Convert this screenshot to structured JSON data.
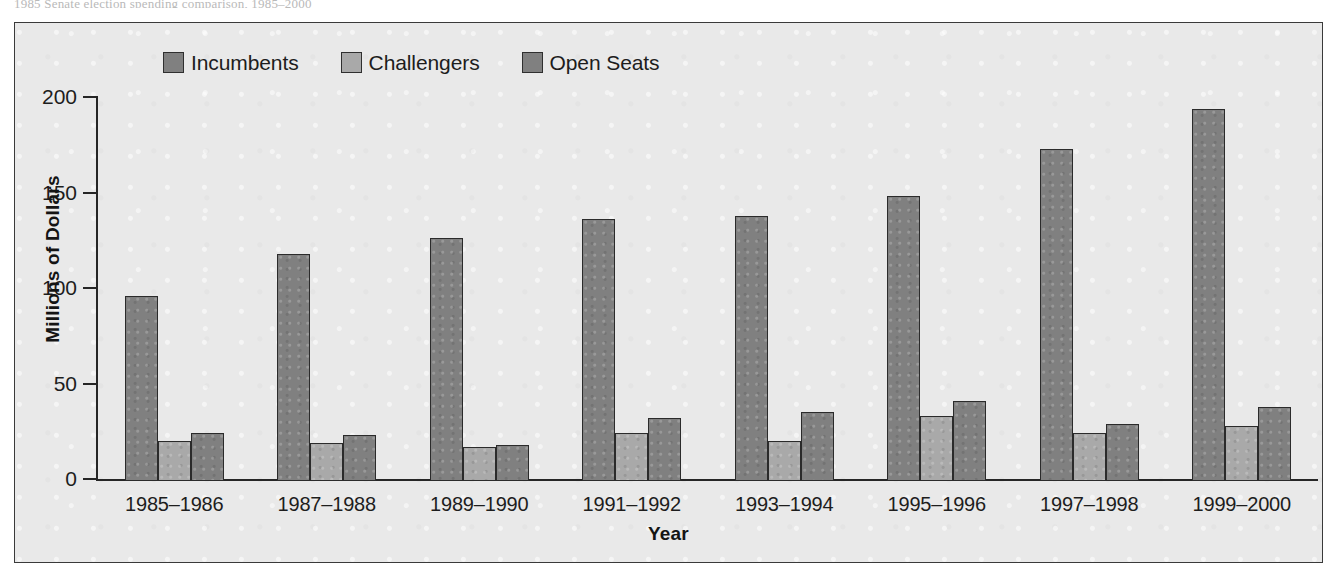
{
  "top_caption": "1985 Senate election spending comparison, 1985–2000",
  "legend": {
    "items": [
      {
        "label": "Incumbents",
        "color": "#808080"
      },
      {
        "label": "Challengers",
        "color": "#a9a9a9"
      },
      {
        "label": "Open Seats",
        "color": "#808080"
      }
    ]
  },
  "axes": {
    "ylabel": "Millions of Dollars",
    "xlabel": "Year",
    "yticks": [
      "200",
      "150",
      "100",
      "50",
      "0"
    ]
  },
  "chart_data": {
    "type": "bar",
    "title": "",
    "xlabel": "Year",
    "ylabel": "Millions of Dollars",
    "ylim": [
      0,
      200
    ],
    "yticks": [
      0,
      50,
      100,
      150,
      200
    ],
    "grid": false,
    "legend_position": "top-left",
    "categories": [
      "1985–1986",
      "1987–1988",
      "1989–1990",
      "1991–1992",
      "1993–1994",
      "1995–1996",
      "1997–1998",
      "1999–2000"
    ],
    "series": [
      {
        "name": "Incumbents",
        "color": "#808080",
        "values": [
          97,
          119,
          127,
          137,
          139,
          149,
          174,
          195
        ]
      },
      {
        "name": "Challengers",
        "color": "#a9a9a9",
        "values": [
          21,
          20,
          18,
          25,
          21,
          34,
          25,
          29
        ]
      },
      {
        "name": "Open Seats",
        "color": "#808080",
        "values": [
          25,
          24,
          19,
          33,
          36,
          42,
          30,
          39
        ]
      }
    ]
  }
}
